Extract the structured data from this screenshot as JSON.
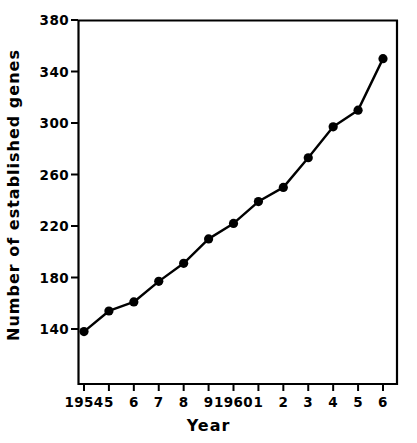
{
  "chart_data": {
    "type": "line",
    "title": "",
    "subtitle": "",
    "xlabel": "Year",
    "ylabel": "Number of established genes",
    "x": [
      1954,
      1955,
      1956,
      1957,
      1958,
      1959,
      1960,
      1961,
      1962,
      1963,
      1964,
      1965,
      1966
    ],
    "categories": [
      "1954",
      "5",
      "6",
      "7",
      "8",
      "9",
      "1960",
      "1",
      "2",
      "3",
      "4",
      "5",
      "6"
    ],
    "values": [
      138,
      154,
      161,
      177,
      191,
      210,
      222,
      239,
      250,
      273,
      297,
      310,
      350
    ],
    "series": [
      {
        "name": "Number of established genes",
        "values": [
          138,
          154,
          161,
          177,
          191,
          210,
          222,
          239,
          250,
          273,
          297,
          310,
          350
        ]
      }
    ],
    "ylim": [
      120,
      380
    ],
    "yticks": [
      140,
      180,
      220,
      260,
      300,
      340,
      380
    ],
    "ytick_labels": [
      "140",
      "180",
      "220",
      "260",
      "300",
      "340",
      "380"
    ],
    "xtick_labels": [
      "1954",
      "5",
      "6",
      "7",
      "8",
      "9",
      "1960",
      "1",
      "2",
      "3",
      "4",
      "5",
      "6"
    ],
    "grid": false,
    "legend": null,
    "marker": "filled-circle",
    "line_color": "#000000",
    "marker_color": "#000000",
    "background_color": "#ffffff",
    "axis_color": "#000000"
  }
}
